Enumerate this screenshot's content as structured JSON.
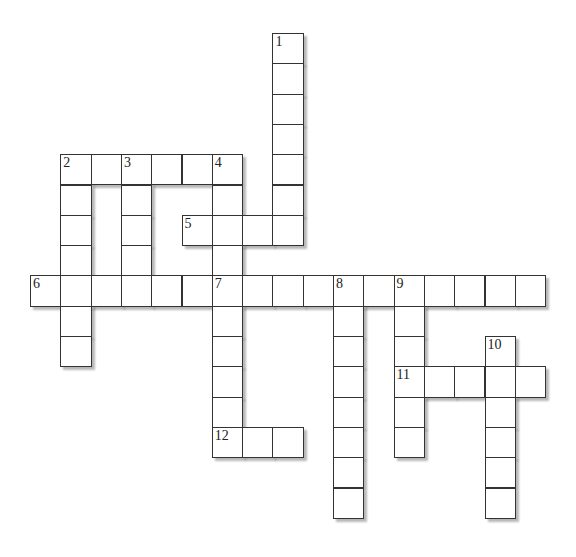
{
  "puzzle": {
    "type": "crossword",
    "cell_size": 30.3,
    "origin_x": 30,
    "origin_y": 33,
    "border_color": "#333333",
    "cell_fill": "#ffffff",
    "words": [
      {
        "number": "1",
        "direction": "down",
        "row": 0,
        "col": 8,
        "length": 7
      },
      {
        "number": "2",
        "direction": "across",
        "row": 4,
        "col": 1,
        "length": 6
      },
      {
        "number": "2",
        "direction": "down",
        "row": 4,
        "col": 1,
        "length": 7
      },
      {
        "number": "3",
        "direction": "down",
        "row": 4,
        "col": 3,
        "length": 5
      },
      {
        "number": "4",
        "direction": "down",
        "row": 4,
        "col": 6,
        "length": 10
      },
      {
        "number": "5",
        "direction": "across",
        "row": 6,
        "col": 5,
        "length": 4
      },
      {
        "number": "6",
        "direction": "across",
        "row": 8,
        "col": 0,
        "length": 6
      },
      {
        "number": "7",
        "direction": "across",
        "row": 8,
        "col": 6,
        "length": 11
      },
      {
        "number": "8",
        "direction": "down",
        "row": 8,
        "col": 10,
        "length": 8
      },
      {
        "number": "9",
        "direction": "down",
        "row": 8,
        "col": 12,
        "length": 6
      },
      {
        "number": "10",
        "direction": "down",
        "row": 10,
        "col": 15,
        "length": 6
      },
      {
        "number": "11",
        "direction": "across",
        "row": 11,
        "col": 12,
        "length": 5
      },
      {
        "number": "12",
        "direction": "across",
        "row": 13,
        "col": 6,
        "length": 3
      }
    ]
  }
}
